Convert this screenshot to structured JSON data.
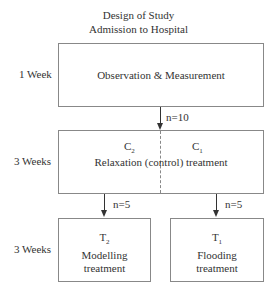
{
  "title": {
    "line1": "Design of Study",
    "line2": "Admission to Hospital"
  },
  "stages": [
    {
      "duration": "1 Week",
      "box": "Observation & Measurement"
    },
    {
      "duration": "3 Weeks",
      "box": "Relaxation (control) treatment",
      "groups": [
        {
          "name": "C",
          "sub": "2"
        },
        {
          "name": "C",
          "sub": "1"
        }
      ]
    },
    {
      "duration": "3 Weeks",
      "boxes": [
        {
          "name": "T",
          "sub": "2",
          "line1": "Modelling",
          "line2": "treatment"
        },
        {
          "name": "T",
          "sub": "1",
          "line1": "Flooding",
          "line2": "treatment"
        }
      ]
    }
  ],
  "arrows": {
    "to_control": "n=10",
    "to_modelling": "n=5",
    "to_flooding": "n=5"
  }
}
